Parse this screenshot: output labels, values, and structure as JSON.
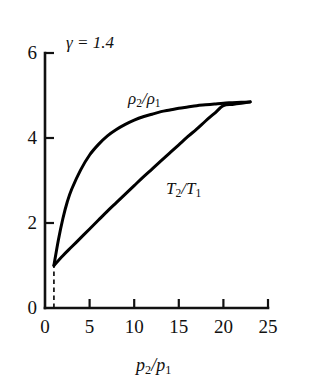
{
  "figure": {
    "background_color": "#ffffff",
    "line_color": "#000000"
  },
  "chart_data": {
    "type": "line",
    "title": "",
    "subtitle": "",
    "xlabel": "p2/p1",
    "ylabel": "",
    "xlim": [
      0,
      25
    ],
    "ylim": [
      0,
      6
    ],
    "xticks": [
      0,
      5,
      10,
      15,
      20,
      25
    ],
    "yticks": [
      0,
      2,
      4,
      6
    ],
    "xtick_labels": [
      "0",
      "5",
      "10",
      "15",
      "20",
      "25"
    ],
    "ytick_labels": [
      "0",
      "2",
      "4",
      "6"
    ],
    "grid": false,
    "legend": "inline-annotations",
    "annotations": [
      {
        "name": "gamma-annotation",
        "text_html": "&#947; = 1.4",
        "symbol": "gamma",
        "value": "1.4",
        "x_px": 66,
        "y_px": 34
      }
    ],
    "reference_lines": [
      {
        "name": "origin-dashed-line",
        "style": "dashed",
        "from": [
          1,
          0
        ],
        "to": [
          1,
          1
        ],
        "description": "vertical dashed line at p2/p1 = 1 up to ratio = 1"
      }
    ],
    "series": [
      {
        "name": "density-ratio",
        "label_html": "&#961;<sub>2</sub>/&#961;<sub>1</sub>",
        "label_plain": "rho2/rho1",
        "label_x_px": 128,
        "label_y_px": 90,
        "color": "#000000",
        "line_width_px": 3,
        "x": [
          1,
          1.5,
          2,
          2.5,
          3,
          4,
          5,
          6,
          7,
          8,
          9,
          10,
          11,
          12,
          13,
          14,
          15,
          16,
          17,
          18,
          19,
          20,
          21,
          22,
          23
        ],
        "y": [
          1.0,
          1.33,
          1.63,
          1.87,
          2.08,
          2.4,
          2.64,
          2.82,
          2.97,
          3.09,
          3.2,
          3.29,
          3.36,
          3.43,
          3.49,
          3.54,
          3.58,
          3.63,
          3.66,
          3.7,
          3.73,
          3.76,
          3.79,
          3.81,
          3.83
        ],
        "y_rendered": [
          1.0,
          1.6,
          2.1,
          2.5,
          2.8,
          3.25,
          3.6,
          3.85,
          4.05,
          4.2,
          4.32,
          4.42,
          4.5,
          4.56,
          4.62,
          4.66,
          4.7,
          4.73,
          4.76,
          4.78,
          4.8,
          4.82,
          4.83,
          4.84,
          4.85
        ],
        "endpoint": [
          23,
          4.85
        ]
      },
      {
        "name": "temperature-ratio",
        "label_html": "<i>T</i><sub>2</sub>/<i>T</i><sub>1</sub>",
        "label_plain": "T2/T1",
        "label_x_px": 166,
        "label_y_px": 180,
        "color": "#000000",
        "line_width_px": 3,
        "x": [
          1,
          2,
          3,
          4,
          5,
          6,
          7,
          8,
          9,
          10,
          11,
          12,
          13,
          14,
          15,
          16,
          17,
          18,
          19,
          20,
          21,
          22,
          23
        ],
        "y": [
          1.0,
          1.23,
          1.44,
          1.65,
          1.86,
          2.07,
          2.28,
          2.48,
          2.68,
          2.88,
          3.08,
          3.27,
          3.46,
          3.65,
          3.84,
          4.03,
          4.21,
          4.4,
          4.58,
          4.76,
          4.79,
          4.82,
          4.85
        ],
        "endpoint": [
          23,
          4.85
        ]
      }
    ],
    "axes_geometry_px": {
      "x0": 45,
      "y0": 308,
      "x_per_unit": 8.92,
      "y_per_unit": 42.5
    }
  }
}
